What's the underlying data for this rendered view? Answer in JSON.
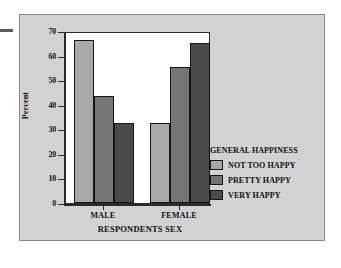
{
  "chart_data": {
    "type": "bar",
    "title": "",
    "xlabel": "RESPONDENTS SEX",
    "ylabel": "Percent",
    "categories": [
      "MALE",
      "FEMALE"
    ],
    "series": [
      {
        "name": "NOT TOO HAPPY",
        "values": [
          67,
          33
        ],
        "color": "#a8a8a8"
      },
      {
        "name": "PRETTY HAPPY",
        "values": [
          44,
          56
        ],
        "color": "#757575"
      },
      {
        "name": "VERY HAPPY",
        "values": [
          33,
          66
        ],
        "color": "#4a4a4a"
      }
    ],
    "ylim": [
      0,
      70
    ],
    "yticks": [
      0,
      10,
      20,
      30,
      40,
      50,
      60,
      70
    ],
    "grid": false,
    "legend": {
      "title": "GENERAL HAPPINESS",
      "position": "right"
    }
  },
  "axis": {
    "y_title": "Percent",
    "x_title": "RESPONDENTS SEX",
    "y_tick_labels": [
      "70",
      "60",
      "50",
      "40",
      "30",
      "20",
      "10",
      "0"
    ],
    "x_tick_labels": [
      "MALE",
      "FEMALE"
    ]
  },
  "legend": {
    "title": "GENERAL HAPPINESS",
    "items": [
      {
        "label": "NOT TOO HAPPY",
        "color": "#a8a8a8"
      },
      {
        "label": "PRETTY HAPPY",
        "color": "#757575"
      },
      {
        "label": "VERY HAPPY",
        "color": "#4a4a4a"
      }
    ]
  },
  "colors": {
    "panel_background": "#d2d2d2",
    "plot_background": "#ffffff",
    "axis": "#2b2b2b",
    "text": "#111111"
  }
}
